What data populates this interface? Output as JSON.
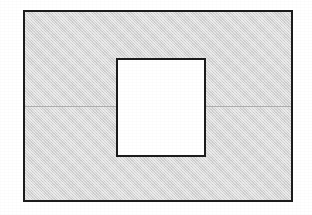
{
  "figure": {
    "title": "",
    "caption": "",
    "background_color": "#ffffff",
    "stroke_color": "#1c1c1c",
    "fill_color": "#d7d7d7",
    "inner_fill_color": "#ffffff",
    "centerline_color": "#b0b0b0"
  },
  "shapes": {
    "outer_rectangle": {
      "name": "outer-rectangle",
      "label": "",
      "x": 23,
      "y": 10,
      "width": 270,
      "height": 192,
      "fill": "#d7d7d7",
      "stroke": "#1c1c1c",
      "stroke_width": 2
    },
    "inner_square": {
      "name": "inner-square",
      "label": "",
      "x": 116,
      "y": 58,
      "width": 90,
      "height": 99,
      "fill": "#ffffff",
      "stroke": "#1c1c1c",
      "stroke_width": 2
    },
    "centerline_left": {
      "name": "centerline-left-segment",
      "label": "",
      "x": 25,
      "y": 106,
      "width": 92,
      "height": 1,
      "stroke": "#b0b0b0"
    },
    "centerline_right": {
      "name": "centerline-right-segment",
      "label": "",
      "x": 206,
      "y": 106,
      "width": 85,
      "height": 1,
      "stroke": "#b0b0b0"
    }
  },
  "annotations": [],
  "labels": []
}
